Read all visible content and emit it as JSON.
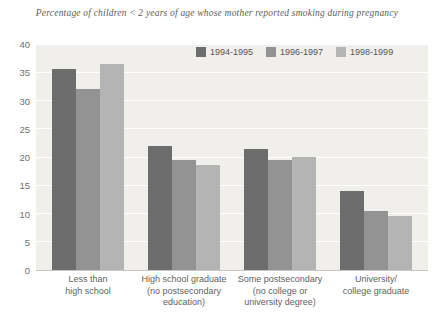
{
  "chart_data": {
    "type": "bar",
    "title": "Percentage of children < 2 years of age whose mother reported smoking during pregnancy",
    "xlabel": "",
    "ylabel": "",
    "ylim": [
      0,
      40
    ],
    "ytick_step": 5,
    "yticks": [
      "40",
      "35",
      "30",
      "25",
      "20",
      "15",
      "10",
      "5",
      "0"
    ],
    "grid": true,
    "legend_position": "top-right-inside",
    "categories": [
      [
        "Less than",
        "high school"
      ],
      [
        "High school graduate",
        "(no postsecondary",
        "education)"
      ],
      [
        "Some postsecondary",
        "(no college or",
        "university degree)"
      ],
      [
        "University/",
        "college graduate"
      ]
    ],
    "series": [
      {
        "name": "1994-1995",
        "color": "#6d6d6d",
        "values": [
          35.5,
          22.0,
          21.5,
          14.0
        ]
      },
      {
        "name": "1996-1997",
        "color": "#939393",
        "values": [
          32.0,
          19.5,
          19.5,
          10.5
        ]
      },
      {
        "name": "1998-1999",
        "color": "#b4b4b4",
        "values": [
          36.5,
          18.5,
          20.0,
          9.5
        ]
      }
    ]
  },
  "colors": {
    "plot_background": "#f1efec",
    "gridline": "#ffffff",
    "axis": "#c9c6c2",
    "text": "#5f5f5f",
    "title_text": "#5c5c5c",
    "page_background": "#ffffff"
  }
}
